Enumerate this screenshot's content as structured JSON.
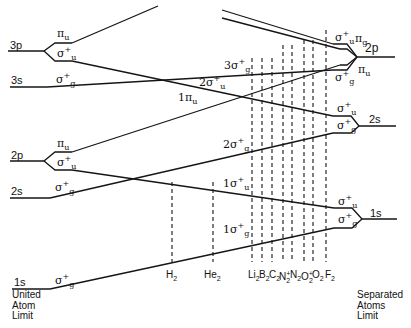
{
  "united_atom": {
    "label_lines": [
      "United",
      "Atom",
      "Limit"
    ],
    "levels": [
      {
        "name": "3p",
        "label": "3p",
        "orbitals": [
          {
            "sym": "π",
            "sub": "u",
            "sup": ""
          },
          {
            "sym": "σ",
            "sub": "u",
            "sup": "+"
          }
        ]
      },
      {
        "name": "3s",
        "label": "3s",
        "orbitals": [
          {
            "sym": "σ",
            "sub": "g",
            "sup": "+"
          }
        ]
      },
      {
        "name": "2p",
        "label": "2p",
        "orbitals": [
          {
            "sym": "π",
            "sub": "u",
            "sup": ""
          },
          {
            "sym": "σ",
            "sub": "u",
            "sup": "+"
          }
        ]
      },
      {
        "name": "2s",
        "label": "2s",
        "orbitals": [
          {
            "sym": "σ",
            "sub": "g",
            "sup": "+"
          }
        ]
      },
      {
        "name": "1s",
        "label": "1s",
        "orbitals": [
          {
            "sym": "σ",
            "sub": "g",
            "sup": "+"
          }
        ]
      }
    ]
  },
  "separated_atoms": {
    "label_lines": [
      "Separated",
      "Atoms",
      "Limit"
    ],
    "levels": [
      {
        "name": "2p",
        "label": "2p",
        "orbitals": [
          {
            "sym": "σ",
            "sub": "u",
            "sup": "+"
          },
          {
            "sym": "π",
            "sub": "g",
            "sup": ""
          },
          {
            "sym": "π",
            "sub": "u",
            "sup": ""
          },
          {
            "sym": "σ",
            "sub": "g",
            "sup": "+"
          }
        ]
      },
      {
        "name": "2s",
        "label": "2s",
        "orbitals": [
          {
            "sym": "σ",
            "sub": "u",
            "sup": "+"
          },
          {
            "sym": "σ",
            "sub": "g",
            "sup": "+"
          }
        ]
      },
      {
        "name": "1s",
        "label": "1s",
        "orbitals": [
          {
            "sym": "σ",
            "sub": "u",
            "sup": "+"
          },
          {
            "sym": "σ",
            "sub": "g",
            "sup": "+"
          }
        ]
      }
    ]
  },
  "mo_labels": [
    {
      "prefix": "3",
      "sym": "σ",
      "sub": "g",
      "sup": "+"
    },
    {
      "prefix": "2",
      "sym": "σ",
      "sub": "u",
      "sup": "+"
    },
    {
      "prefix": "1",
      "sym": "π",
      "sub": "u",
      "sup": ""
    },
    {
      "prefix": "2",
      "sym": "σ",
      "sub": "g",
      "sup": "+"
    },
    {
      "prefix": "1",
      "sym": "σ",
      "sub": "u",
      "sup": "+"
    },
    {
      "prefix": "1",
      "sym": "σ",
      "sub": "g",
      "sup": "+"
    }
  ],
  "molecules": [
    {
      "base": "H",
      "sub": "2",
      "sup": ""
    },
    {
      "base": "He",
      "sub": "2",
      "sup": ""
    },
    {
      "base": "Li",
      "sub": "2",
      "sup": ""
    },
    {
      "base": "B",
      "sub": "2",
      "sup": ""
    },
    {
      "base": "C",
      "sub": "2",
      "sup": ""
    },
    {
      "base": "N",
      "sub": "2",
      "sup": "+"
    },
    {
      "base": "N",
      "sub": "2",
      "sup": ""
    },
    {
      "base": "O",
      "sub": "2",
      "sup": "+"
    },
    {
      "base": "O",
      "sub": "2",
      "sup": ""
    },
    {
      "base": "F",
      "sub": "2",
      "sup": ""
    }
  ]
}
